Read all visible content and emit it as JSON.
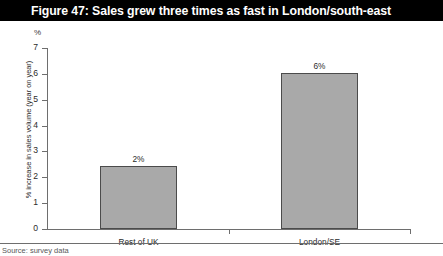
{
  "figure_title": "Figure 47: Sales grew three times as fast in London/south-east",
  "footer_caption": "Source: survey data",
  "chart_data": {
    "type": "bar",
    "title": "Figure 47: Sales grew three times as fast in London/south-east",
    "categories": [
      "Rest of UK",
      "London/SE"
    ],
    "values": [
      2.45,
      6.05
    ],
    "data_labels": [
      "2%",
      "6%"
    ],
    "xlabel": "",
    "ylabel": "% increase in sales volume (year on year)",
    "y_unit": "%",
    "ylim": [
      0,
      7
    ],
    "yticks": [
      0,
      1,
      2,
      3,
      4,
      5,
      6,
      7
    ],
    "ytick_labels": [
      "0",
      "1",
      "2",
      "3",
      "4",
      "5",
      "6",
      "7"
    ],
    "grid": false,
    "legend": false,
    "bar_color": "#a9a9a9",
    "bar_border_color": "#4b4b4b",
    "axis_color": "#6e6e6e",
    "title_background": "#000000",
    "title_color": "#ffffff"
  }
}
